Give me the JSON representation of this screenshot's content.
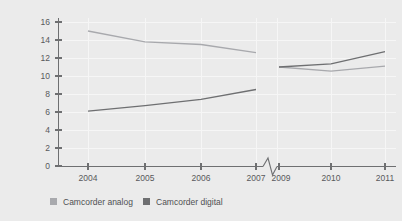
{
  "chart_data": {
    "type": "line",
    "title": "",
    "subtitle": "",
    "xlabel": "",
    "ylabel": "",
    "ylim": [
      0,
      16
    ],
    "yticks": [
      0,
      2,
      4,
      6,
      8,
      10,
      12,
      14,
      16
    ],
    "categories": [
      "2004",
      "2005",
      "2006",
      "2007",
      "2009",
      "2010",
      "2011"
    ],
    "axis_break": {
      "present": true,
      "between": [
        "2007",
        "2009"
      ],
      "style": "zigzag"
    },
    "grid": "faint-white-vertical-and-horizontal",
    "legend_position": "bottom-left",
    "series": [
      {
        "name": "Camcorder analog",
        "color": "#a8a9ad",
        "values": [
          15.0,
          13.8,
          13.5,
          12.6,
          11.0,
          10.55,
          11.1
        ]
      },
      {
        "name": "Camcorder digital",
        "color": "#6e6f71",
        "values": [
          6.1,
          6.7,
          7.4,
          8.5,
          11.0,
          11.35,
          12.7
        ]
      }
    ]
  },
  "axis": {
    "y_tick_labels": [
      "16",
      "14",
      "12",
      "10",
      "8",
      "6",
      "4",
      "2",
      "0"
    ],
    "x_tick_labels": [
      "2004",
      "2005",
      "2006",
      "2007",
      "2009",
      "2010",
      "2011"
    ]
  },
  "legend": {
    "items": [
      {
        "label": "Camcorder analog",
        "color": "#a8a9ad"
      },
      {
        "label": "Camcorder digital",
        "color": "#6e6f71"
      }
    ]
  },
  "colors": {
    "background": "#ebebeb",
    "axis": "#6e6f71",
    "gridline": "#f6f6f6",
    "text": "#58595b",
    "analog": "#a8a9ad",
    "digital": "#6e6f71"
  }
}
